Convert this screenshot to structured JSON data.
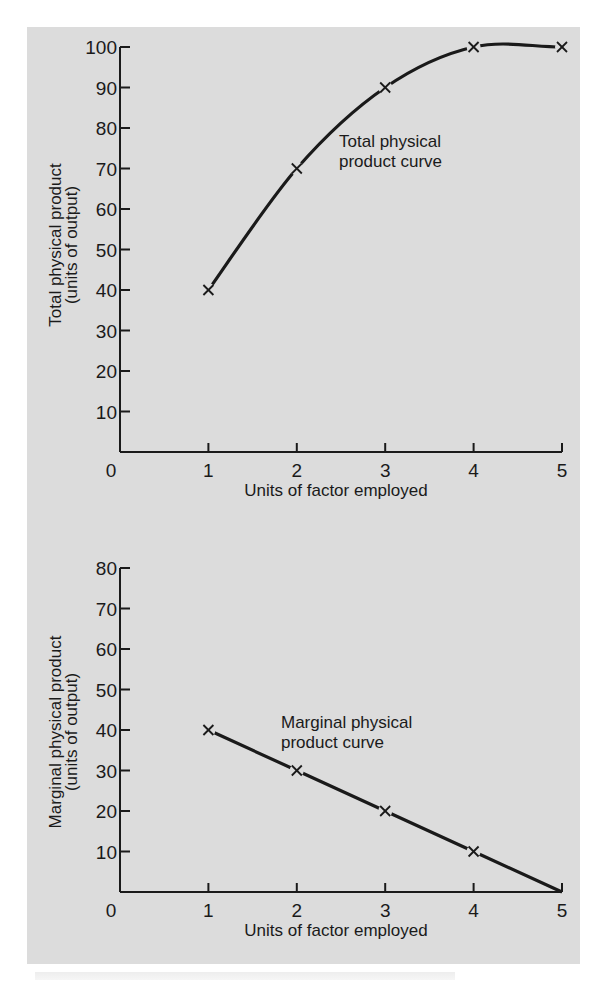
{
  "background_color": "#dcdcdc",
  "ink_color": "#1a1a1a",
  "chart_data": [
    {
      "type": "line",
      "title": "",
      "xlabel": "Units of factor employed",
      "ylabel": [
        "Total physical product",
        "(units of output)"
      ],
      "x": [
        1,
        2,
        3,
        4,
        5
      ],
      "series": [
        {
          "name": "Total physical product curve",
          "values": [
            40,
            70,
            90,
            100,
            100
          ],
          "marker": "x",
          "smooth": true
        }
      ],
      "xlim": [
        0,
        5
      ],
      "ylim": [
        0,
        100
      ],
      "xticks": [
        "0",
        "1",
        "2",
        "3",
        "4",
        "5"
      ],
      "yticks": [
        "10",
        "20",
        "30",
        "40",
        "50",
        "60",
        "70",
        "80",
        "90",
        "100"
      ],
      "annotation": [
        "Total physical",
        "product curve"
      ],
      "grid": false
    },
    {
      "type": "line",
      "title": "",
      "xlabel": "Units of factor employed",
      "ylabel": [
        "Marginal physical product",
        "(units of output)"
      ],
      "x": [
        1,
        2,
        3,
        4,
        5
      ],
      "series": [
        {
          "name": "Marginal physical product curve",
          "values": [
            40,
            30,
            20,
            10,
            0
          ],
          "marker": "x",
          "marker_skip_last": true
        }
      ],
      "xlim": [
        0,
        5
      ],
      "ylim": [
        0,
        80
      ],
      "xticks": [
        "0",
        "1",
        "2",
        "3",
        "4",
        "5"
      ],
      "yticks": [
        "10",
        "20",
        "30",
        "40",
        "50",
        "60",
        "70",
        "80"
      ],
      "annotation": [
        "Marginal physical",
        "product curve"
      ],
      "grid": false
    }
  ]
}
